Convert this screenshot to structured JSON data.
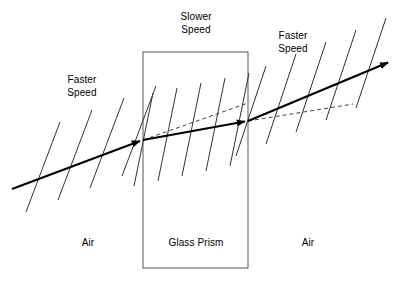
{
  "figure": {
    "background_color": "#ffffff",
    "stroke_color": "#000000",
    "width": 412,
    "height": 286
  },
  "labels": {
    "slower_speed": "Slower\nSpeed",
    "faster_speed_left": "Faster\nSpeed",
    "faster_speed_right": "Faster\nSpeed",
    "air_left": "Air",
    "glass_prism": "Glass Prism",
    "air_right": "Air"
  },
  "prism": {
    "name": "Glass Prism",
    "x": 143,
    "y": 52,
    "width": 105,
    "height": 216,
    "fill": "none",
    "stroke": "#555555",
    "stroke_width": 1
  },
  "ray": {
    "color": "#000000",
    "stroke_width": 2.2,
    "segments": [
      {
        "name": "incident-ray",
        "medium": "air",
        "x1": 12,
        "y1": 189,
        "x2": 143,
        "y2": 140,
        "arrow_at_end": true
      },
      {
        "name": "refracted-ray-in-glass",
        "medium": "glass",
        "x1": 143,
        "y1": 140,
        "x2": 248,
        "y2": 121,
        "arrow_at_end": true
      },
      {
        "name": "emergent-ray",
        "medium": "air",
        "x1": 248,
        "y1": 121,
        "x2": 392,
        "y2": 61,
        "arrow_at_end": true
      }
    ]
  },
  "dashed_paths": [
    {
      "name": "undeviated-path-in-glass",
      "x1": 143,
      "y1": 140,
      "x2": 248,
      "y2": 103,
      "dash": "4 3",
      "stroke": "#444444",
      "stroke_width": 1
    },
    {
      "name": "undeviated-path-after-exit",
      "x1": 248,
      "y1": 121,
      "x2": 353,
      "y2": 104,
      "dash": "4 3",
      "stroke": "#444444",
      "stroke_width": 1
    }
  ],
  "wavefronts": {
    "air_left": {
      "count": 4,
      "spacing_px": 32,
      "note": "widely spaced wavefronts in air, perpendicular to the incident ray",
      "lines": [
        {
          "x1": 60,
          "y1": 122,
          "x2": 26,
          "y2": 212
        },
        {
          "x1": 92,
          "y1": 110,
          "x2": 58,
          "y2": 200
        },
        {
          "x1": 124,
          "y1": 98,
          "x2": 90,
          "y2": 188
        },
        {
          "x1": 156,
          "y1": 86,
          "x2": 122,
          "y2": 176
        }
      ]
    },
    "glass": {
      "count": 5,
      "spacing_px": 24,
      "note": "closely spaced, steeper wavefronts inside the glass (slower speed)",
      "lines": [
        {
          "x1": 153,
          "y1": 93,
          "x2": 134,
          "y2": 186
        },
        {
          "x1": 177,
          "y1": 88,
          "x2": 158,
          "y2": 181
        },
        {
          "x1": 201,
          "y1": 83,
          "x2": 182,
          "y2": 176
        },
        {
          "x1": 225,
          "y1": 78,
          "x2": 206,
          "y2": 171
        },
        {
          "x1": 249,
          "y1": 73,
          "x2": 230,
          "y2": 166
        }
      ]
    },
    "air_right": {
      "count": 5,
      "spacing_px": 30,
      "note": "widely spaced wavefronts again in air, perpendicular to the emergent ray",
      "lines": [
        {
          "x1": 266,
          "y1": 66,
          "x2": 236,
          "y2": 156
        },
        {
          "x1": 296,
          "y1": 54,
          "x2": 266,
          "y2": 144
        },
        {
          "x1": 326,
          "y1": 42,
          "x2": 296,
          "y2": 132
        },
        {
          "x1": 356,
          "y1": 30,
          "x2": 326,
          "y2": 120
        },
        {
          "x1": 386,
          "y1": 18,
          "x2": 356,
          "y2": 108
        }
      ]
    }
  },
  "physics": {
    "description": "A light ray travelling through air strikes a glass prism, slows and bends toward the normal, then speeds up and bends away from the normal on exit.",
    "speed_in_air": "Faster Speed",
    "speed_in_glass": "Slower Speed"
  }
}
